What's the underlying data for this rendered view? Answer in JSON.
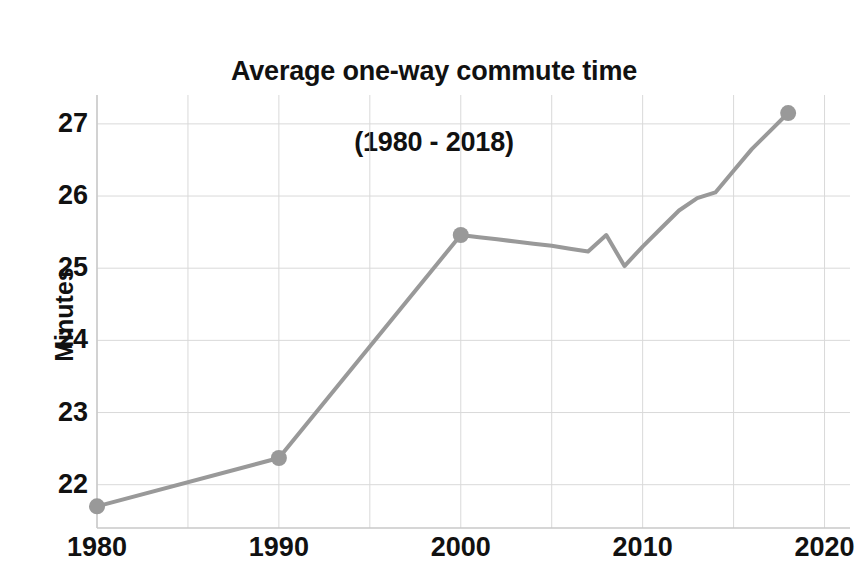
{
  "chart_data": {
    "type": "line",
    "title": "Average one-way commute time",
    "subtitle": "(1980 - 2018)",
    "title_line1": "Average one-way commute time",
    "title_line2": "(1980 - 2018)",
    "xlabel": "",
    "ylabel": "Minutes",
    "xlim": [
      1980,
      2021.4
    ],
    "ylim": [
      21.4,
      27.4
    ],
    "x_ticks": [
      1980,
      1990,
      2000,
      2010,
      2020
    ],
    "x_tick_labels": [
      "1980",
      "1990",
      "2000",
      "2010",
      "2020"
    ],
    "x_minor_gridlines": [
      1985,
      1995,
      2005,
      2015
    ],
    "y_ticks": [
      22,
      23,
      24,
      25,
      26,
      27
    ],
    "y_tick_labels": [
      "22",
      "23",
      "24",
      "25",
      "26",
      "27"
    ],
    "grid": true,
    "legend": "none",
    "line_color": "#999999",
    "marker_color": "#999999",
    "grid_color": "#d9d9d9",
    "axis_color": "#c8c8c8",
    "text_color": "#111111",
    "line_width": 4,
    "marker_size": 16,
    "marker_years": [
      1980,
      1990,
      2000,
      2018
    ],
    "x": [
      1980,
      1990,
      2000,
      2001,
      2002,
      2003,
      2004,
      2005,
      2006,
      2007,
      2008,
      2009,
      2010,
      2011,
      2012,
      2013,
      2014,
      2015,
      2016,
      2017,
      2018
    ],
    "values": [
      21.7,
      22.37,
      25.46,
      25.43,
      25.4,
      25.37,
      25.34,
      25.31,
      25.27,
      25.23,
      25.46,
      25.03,
      25.3,
      25.55,
      25.8,
      25.97,
      26.05,
      26.35,
      26.65,
      26.9,
      27.15
    ],
    "series": [
      {
        "name": "Average one-way commute time",
        "values": [
          21.7,
          22.37,
          25.46,
          25.43,
          25.4,
          25.37,
          25.34,
          25.31,
          25.27,
          25.23,
          25.46,
          25.03,
          25.3,
          25.55,
          25.8,
          25.97,
          26.05,
          26.35,
          26.65,
          26.9,
          27.15
        ]
      }
    ],
    "annotations": []
  }
}
